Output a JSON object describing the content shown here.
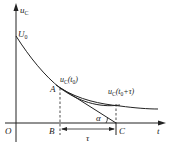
{
  "diagram": {
    "axes": {
      "y_label": "u",
      "y_label_sub": "C",
      "x_label": "t",
      "origin_label": "O"
    },
    "initial_value_label": "U",
    "initial_value_sub": "0",
    "points": {
      "A": "A",
      "B": "B",
      "C": "C"
    },
    "curve_label_t0": {
      "main": "u",
      "sub": "C",
      "arg": "(t",
      "arg_sub": "0",
      "close": ")"
    },
    "curve_label_t0_tau": {
      "main": "u",
      "sub": "C",
      "arg": "(t",
      "arg_sub": "0",
      "rest": "+τ)"
    },
    "angle_label": "α",
    "interval_label": "τ",
    "colors": {
      "line": "#222222",
      "background": "#ffffff"
    }
  }
}
